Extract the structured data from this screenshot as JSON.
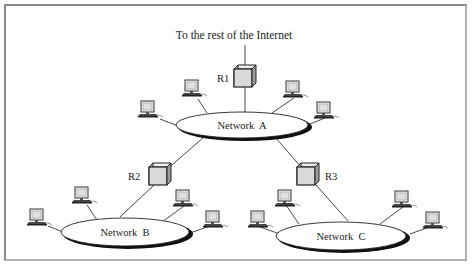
{
  "diagram": {
    "top_label": "To the rest of the Internet",
    "routers": [
      {
        "id": "R1",
        "label": "R1"
      },
      {
        "id": "R2",
        "label": "R2"
      },
      {
        "id": "R3",
        "label": "R3"
      }
    ],
    "networks": [
      {
        "id": "A",
        "label": "Network  A"
      },
      {
        "id": "B",
        "label": "Network  B"
      },
      {
        "id": "C",
        "label": "Network  C"
      }
    ],
    "colors": {
      "line": "#333333",
      "router_face": "#d9d9d9",
      "router_side": "#bdbdbd",
      "network_fill": "#ffffff",
      "network_shadow": "#111111",
      "frame": "#8a8a8a"
    }
  }
}
